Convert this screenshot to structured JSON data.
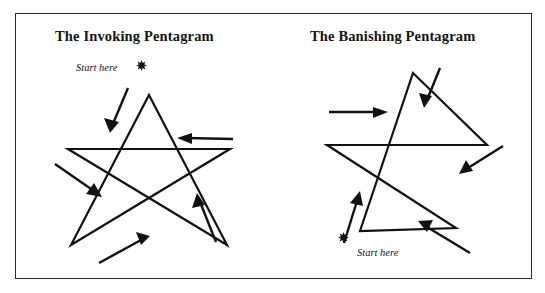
{
  "figure": {
    "corner_mark": "",
    "border_color": "#2a2a2a",
    "ink_color": "#111111",
    "background": "#ffffff"
  },
  "panels": [
    {
      "id": "invoking",
      "title": "The Invoking Pentagram",
      "start_label": "Start here",
      "start_marker": "burst-dot",
      "direction_summary": "Begins at lower-left point, drawn down-left first, then anticlockwise sequence",
      "arrows": [
        {
          "name": "arrow-down-left-top",
          "direction": "down-left",
          "x1": 128,
          "y1": 88,
          "x2": 110,
          "y2": 131
        },
        {
          "name": "arrow-left-upper-right",
          "direction": "left",
          "x1": 233,
          "y1": 139,
          "x2": 177,
          "y2": 138
        },
        {
          "name": "arrow-down-right-left",
          "direction": "down-right",
          "x1": 55,
          "y1": 164,
          "x2": 101,
          "y2": 196
        },
        {
          "name": "arrow-up-right-bottom",
          "direction": "up-right",
          "x1": 99,
          "y1": 263,
          "x2": 149,
          "y2": 236
        },
        {
          "name": "arrow-up-left-right",
          "direction": "up",
          "x1": 216,
          "y1": 242,
          "x2": 197,
          "y2": 194
        }
      ]
    },
    {
      "id": "banishing",
      "title": "The Banishing Pentagram",
      "start_label": "Start here",
      "start_marker": "burst-dot",
      "direction_summary": "Begins at lower-left point, drawn up-right first, then clockwise sequence",
      "arrows": [
        {
          "name": "arrow-right-upper-left",
          "direction": "right",
          "x1": 329,
          "y1": 112,
          "x2": 387,
          "y2": 112
        },
        {
          "name": "arrow-down-left-top",
          "direction": "down-left",
          "x1": 440,
          "y1": 68,
          "x2": 424,
          "y2": 107
        },
        {
          "name": "arrow-down-left-right",
          "direction": "down-left",
          "x1": 503,
          "y1": 146,
          "x2": 460,
          "y2": 173
        },
        {
          "name": "arrow-up-left-side",
          "direction": "up",
          "x1": 344,
          "y1": 243,
          "x2": 359,
          "y2": 192
        },
        {
          "name": "arrow-up-left-bottom",
          "direction": "up-left",
          "x1": 470,
          "y1": 253,
          "x2": 419,
          "y2": 222
        }
      ]
    }
  ],
  "geometry": {
    "invoking_star_points": "Five-pointed star, single continuous stroke, apex at top",
    "banishing_star_points": "Five-pointed star, single continuous stroke, apex at top"
  }
}
